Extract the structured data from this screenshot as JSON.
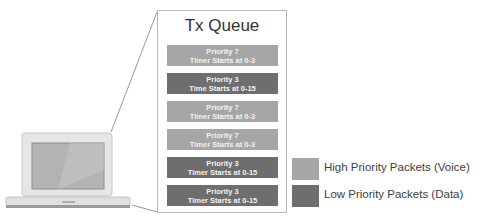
{
  "queue": {
    "title": "Tx Queue",
    "packets": [
      {
        "line1": "Priority 7",
        "line2": "Timer Starts at 0-3",
        "type": "high"
      },
      {
        "line1": "Priority 3",
        "line2": "Time Starts at 0-15",
        "type": "low"
      },
      {
        "line1": "Priority 7",
        "line2": "Timer Starts at 0-3",
        "type": "high"
      },
      {
        "line1": "Priority 7",
        "line2": "Timer Starts at 0-3",
        "type": "high"
      },
      {
        "line1": "Priority 3",
        "line2": "Timer Starts at 0-15",
        "type": "low"
      },
      {
        "line1": "Priority 3",
        "line2": "Timer Starts at 0-15",
        "type": "low"
      }
    ]
  },
  "legend": {
    "high": {
      "label": "High Priority Packets (Voice)",
      "color": "#a6a6a6"
    },
    "low": {
      "label": "Low Priority Packets (Data)",
      "color": "#6e6e6e"
    }
  },
  "icons": {
    "device": "laptop-icon"
  }
}
